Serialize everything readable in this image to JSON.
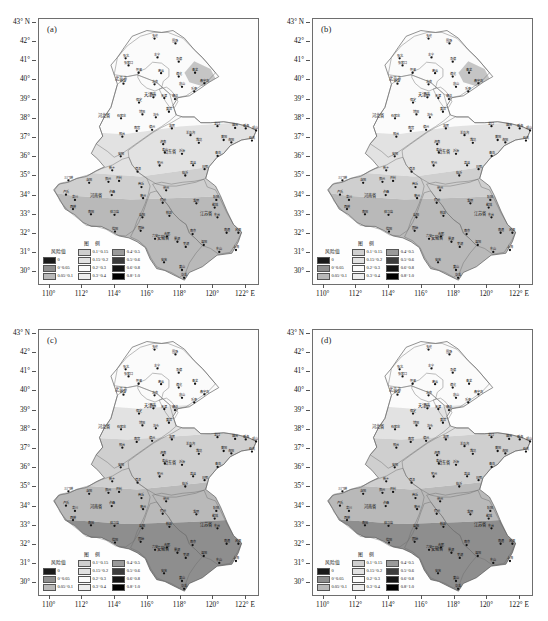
{
  "figure": {
    "type": "four-panel choropleth risk maps",
    "panels": [
      {
        "id": "a",
        "label": "(a)"
      },
      {
        "id": "b",
        "label": "(b)"
      },
      {
        "id": "c",
        "label": "(c)"
      },
      {
        "id": "d",
        "label": "(d)"
      }
    ]
  },
  "axes": {
    "x_ticks": [
      "110°",
      "112°",
      "114°",
      "116°",
      "118°",
      "120°",
      "122° E"
    ],
    "x_values": [
      110,
      112,
      114,
      116,
      118,
      120,
      122
    ],
    "y_ticks": [
      "43° N",
      "42°",
      "41°",
      "40°",
      "39°",
      "38°",
      "37°",
      "36°",
      "35°",
      "34°",
      "33°",
      "32°",
      "31°",
      "30°"
    ],
    "y_values": [
      43,
      42,
      41,
      40,
      39,
      38,
      37,
      36,
      35,
      34,
      33,
      32,
      31,
      30
    ],
    "xlim": [
      109.4,
      122.8
    ],
    "ylim": [
      29.4,
      43.2
    ]
  },
  "legend": {
    "risk_title": "风险值",
    "legend_title": "图 例",
    "col1": [
      {
        "label": "0",
        "color": "#1a1a1a"
      },
      {
        "label": "0~0.05",
        "color": "#8e8e8e"
      },
      {
        "label": "0.05~0.1",
        "color": "#b9b9b9"
      }
    ],
    "col2": [
      {
        "label": "0.1~0.15",
        "color": "#cfcfcf"
      },
      {
        "label": "0.15~0.2",
        "color": "#e2e2e2"
      },
      {
        "label": "0.2~0.3",
        "color": "#fbfbfb"
      },
      {
        "label": "0.3~0.4",
        "color": "#ededed"
      }
    ],
    "col3": [
      {
        "label": "0.4~0.5",
        "color": "#9a9a9a"
      },
      {
        "label": "0.5~0.6",
        "color": "#3c3c3c"
      },
      {
        "label": "0.6~0.8",
        "color": "#141414"
      },
      {
        "label": "0.8~1.0",
        "color": "#000000"
      }
    ]
  },
  "provinces": [
    {
      "name": "北京市",
      "x": 114.4,
      "y": 40.02
    },
    {
      "name": "天津市",
      "x": 116.2,
      "y": 39.2
    },
    {
      "name": "河北省",
      "x": 113.4,
      "y": 38.1
    },
    {
      "name": "山东省",
      "x": 117.4,
      "y": 36.2
    },
    {
      "name": "河南省",
      "x": 112.9,
      "y": 33.95
    },
    {
      "name": "江苏省",
      "x": 119.6,
      "y": 33.0
    },
    {
      "name": "安徽省",
      "x": 117.0,
      "y": 31.75
    }
  ],
  "chart_data": {
    "type": "heatmap",
    "title": "",
    "xlabel": "",
    "ylabel": "",
    "legend_position": "bottom-left",
    "grid": false,
    "classes": [
      "0",
      "0~0.05",
      "0.05~0.1",
      "0.1~0.15",
      "0.15~0.2",
      "0.2~0.3",
      "0.3~0.4",
      "0.4~0.5",
      "0.5~0.6",
      "0.6~0.8",
      "0.8~1.0"
    ],
    "class_colors": [
      "#1a1a1a",
      "#8e8e8e",
      "#b9b9b9",
      "#cfcfcf",
      "#e2e2e2",
      "#fbfbfb",
      "#ededed",
      "#9a9a9a",
      "#3c3c3c",
      "#141414",
      "#000000"
    ],
    "panels": [
      {
        "id": "a",
        "bands": [
          {
            "region": "north (Beijing/Tianjin/north Hebei)",
            "class": "0.2~0.3",
            "color": "#fbfbfb"
          },
          {
            "region": "central Hebei / north Shandong",
            "class": "0.15~0.2",
            "color": "#e2e2e2"
          },
          {
            "region": "south Shandong coastal",
            "class": "0.1~0.15",
            "color": "#cfcfcf"
          },
          {
            "region": "Henan / Anhui / Jiangsu",
            "class": "0.05~0.1",
            "color": "#b9b9b9"
          },
          {
            "region": "NE Shandong peninsula patch",
            "class": "0.1~0.15",
            "color": "#cfcfcf"
          }
        ]
      },
      {
        "id": "b",
        "bands": [
          {
            "region": "north (Beijing/Tianjin/north Hebei)",
            "class": "0.2~0.3",
            "color": "#fbfbfb"
          },
          {
            "region": "central Hebei / north Shandong",
            "class": "0.15~0.2",
            "color": "#e2e2e2"
          },
          {
            "region": "south Shandong coastal",
            "class": "0.1~0.15",
            "color": "#cfcfcf"
          },
          {
            "region": "Henan / Anhui / Jiangsu",
            "class": "0.05~0.1",
            "color": "#b9b9b9"
          },
          {
            "region": "NE Shandong peninsula patch",
            "class": "0.1~0.15",
            "color": "#cfcfcf"
          }
        ]
      },
      {
        "id": "c",
        "bands": [
          {
            "region": "Beijing / Tianjin / north Hebei",
            "class": "0.2~0.3",
            "color": "#fbfbfb"
          },
          {
            "region": "south Hebei",
            "class": "0.1~0.15",
            "color": "#cfcfcf"
          },
          {
            "region": "Shandong",
            "class": "0.05~0.1",
            "color": "#b9b9b9"
          },
          {
            "region": "Henan / Anhui / Jiangsu",
            "class": "0~0.05",
            "color": "#8e8e8e"
          }
        ]
      },
      {
        "id": "d",
        "bands": [
          {
            "region": "Beijing / Tianjin / north Hebei",
            "class": "0.2~0.3",
            "color": "#fbfbfb"
          },
          {
            "region": "south Hebei",
            "class": "0.1~0.15",
            "color": "#cfcfcf"
          },
          {
            "region": "Shandong",
            "class": "0.05~0.1",
            "color": "#b9b9b9"
          },
          {
            "region": "Henan / Anhui / Jiangsu",
            "class": "0~0.05",
            "color": "#8e8e8e"
          }
        ]
      }
    ],
    "stations": [
      {
        "name": "多伦",
        "x": 116.47,
        "y": 42.18
      },
      {
        "name": "张北",
        "x": 114.7,
        "y": 41.15
      },
      {
        "name": "张家口",
        "x": 114.88,
        "y": 40.78
      },
      {
        "name": "丰宁",
        "x": 116.65,
        "y": 41.2
      },
      {
        "name": "承德",
        "x": 117.95,
        "y": 40.98
      },
      {
        "name": "围场",
        "x": 117.75,
        "y": 41.93
      },
      {
        "name": "青龙",
        "x": 118.95,
        "y": 40.4
      },
      {
        "name": "怀来",
        "x": 115.5,
        "y": 40.4
      },
      {
        "name": "密云",
        "x": 116.87,
        "y": 40.38
      },
      {
        "name": "遵化",
        "x": 117.95,
        "y": 40.2
      },
      {
        "name": "秦皇岛",
        "x": 119.52,
        "y": 39.85
      },
      {
        "name": "蔚县",
        "x": 114.57,
        "y": 39.83
      },
      {
        "name": "北京",
        "x": 116.47,
        "y": 39.8
      },
      {
        "name": "霸州",
        "x": 116.4,
        "y": 39.12
      },
      {
        "name": "唐山",
        "x": 118.15,
        "y": 39.67
      },
      {
        "name": "乐亭",
        "x": 118.9,
        "y": 39.43
      },
      {
        "name": "塘沽",
        "x": 117.72,
        "y": 39.03
      },
      {
        "name": "天津",
        "x": 117.07,
        "y": 39.08
      },
      {
        "name": "保定",
        "x": 115.52,
        "y": 38.85
      },
      {
        "name": "黄骅",
        "x": 117.35,
        "y": 38.37
      },
      {
        "name": "石家庄",
        "x": 114.42,
        "y": 38.03
      },
      {
        "name": "饶阳",
        "x": 115.73,
        "y": 38.23
      },
      {
        "name": "泊头",
        "x": 116.55,
        "y": 38.08
      },
      {
        "name": "南宫",
        "x": 115.38,
        "y": 37.37
      },
      {
        "name": "邢台",
        "x": 114.5,
        "y": 37.07
      },
      {
        "name": "德州",
        "x": 116.32,
        "y": 37.43
      },
      {
        "name": "惠民",
        "x": 117.53,
        "y": 37.5
      },
      {
        "name": "羊角沟",
        "x": 118.67,
        "y": 37.15
      },
      {
        "name": "龙口",
        "x": 120.32,
        "y": 37.62
      },
      {
        "name": "烟台",
        "x": 121.4,
        "y": 37.53
      },
      {
        "name": "威海",
        "x": 122.05,
        "y": 37.5
      },
      {
        "name": "成山头",
        "x": 122.68,
        "y": 37.4
      },
      {
        "name": "莱阳",
        "x": 120.7,
        "y": 36.9
      },
      {
        "name": "青岛",
        "x": 120.33,
        "y": 36.07
      },
      {
        "name": "海阳",
        "x": 121.17,
        "y": 36.77
      },
      {
        "name": "石岛",
        "x": 122.43,
        "y": 36.87
      },
      {
        "name": "安阳",
        "x": 114.4,
        "y": 36.05
      },
      {
        "name": "济南",
        "x": 117.0,
        "y": 36.68
      },
      {
        "name": "潍坊",
        "x": 119.18,
        "y": 36.75
      },
      {
        "name": "沂源",
        "x": 118.15,
        "y": 36.18
      },
      {
        "name": "泰山",
        "x": 117.1,
        "y": 36.25
      },
      {
        "name": "兖州",
        "x": 116.78,
        "y": 35.57
      },
      {
        "name": "莒县",
        "x": 118.83,
        "y": 35.58
      },
      {
        "name": "日照",
        "x": 119.53,
        "y": 35.38
      },
      {
        "name": "临沂",
        "x": 118.35,
        "y": 35.05
      },
      {
        "name": "菏泽",
        "x": 115.43,
        "y": 35.25
      },
      {
        "name": "新乡",
        "x": 113.88,
        "y": 35.32
      },
      {
        "name": "三门峡",
        "x": 111.2,
        "y": 34.8
      },
      {
        "name": "洛阳",
        "x": 112.47,
        "y": 34.67
      },
      {
        "name": "郑州",
        "x": 113.65,
        "y": 34.72
      },
      {
        "name": "卢氏",
        "x": 111.05,
        "y": 34.05
      },
      {
        "name": "栾川",
        "x": 111.6,
        "y": 33.78
      },
      {
        "name": "西峡",
        "x": 111.48,
        "y": 33.3
      },
      {
        "name": "南阳",
        "x": 112.58,
        "y": 33.03
      },
      {
        "name": "许昌",
        "x": 113.85,
        "y": 34.03
      },
      {
        "name": "开封",
        "x": 114.3,
        "y": 34.77
      },
      {
        "name": "商丘",
        "x": 115.67,
        "y": 34.45
      },
      {
        "name": "驻马店",
        "x": 114.02,
        "y": 33.0
      },
      {
        "name": "信阳",
        "x": 114.05,
        "y": 32.13
      },
      {
        "name": "固始",
        "x": 115.62,
        "y": 32.17
      },
      {
        "name": "亳州",
        "x": 115.77,
        "y": 33.87
      },
      {
        "name": "徐州",
        "x": 117.18,
        "y": 34.28
      },
      {
        "name": "阜阳",
        "x": 115.73,
        "y": 32.87
      },
      {
        "name": "宿州",
        "x": 116.97,
        "y": 33.63
      },
      {
        "name": "蚌埠",
        "x": 117.38,
        "y": 32.95
      },
      {
        "name": "淮阴",
        "x": 119.03,
        "y": 33.6
      },
      {
        "name": "盐城",
        "x": 120.15,
        "y": 33.38
      },
      {
        "name": "射阳",
        "x": 120.25,
        "y": 33.78
      },
      {
        "name": "南京",
        "x": 118.8,
        "y": 32.0
      },
      {
        "name": "南通",
        "x": 120.88,
        "y": 32.07
      },
      {
        "name": "吕泗",
        "x": 121.6,
        "y": 32.07
      },
      {
        "name": "东台",
        "x": 120.32,
        "y": 32.87
      },
      {
        "name": "合肥",
        "x": 117.23,
        "y": 31.87
      },
      {
        "name": "六安",
        "x": 116.5,
        "y": 31.75
      },
      {
        "name": "巢湖",
        "x": 117.87,
        "y": 31.6
      },
      {
        "name": "安庆",
        "x": 117.05,
        "y": 30.53
      },
      {
        "name": "黄山",
        "x": 118.15,
        "y": 30.13
      },
      {
        "name": "屯溪",
        "x": 118.28,
        "y": 29.72
      },
      {
        "name": "芜湖",
        "x": 118.38,
        "y": 31.33
      },
      {
        "name": "溧阳",
        "x": 119.48,
        "y": 31.43
      },
      {
        "name": "东山",
        "x": 120.43,
        "y": 31.07
      },
      {
        "name": "上海",
        "x": 121.45,
        "y": 31.17
      }
    ]
  }
}
